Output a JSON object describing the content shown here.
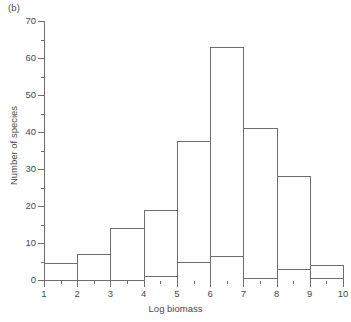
{
  "panel": {
    "label": "(b)"
  },
  "chart_data": {
    "type": "bar",
    "title": "",
    "xlabel": "Log biomass",
    "ylabel": "Number of species",
    "xlim": [
      1,
      10
    ],
    "ylim": [
      0,
      70
    ],
    "x_ticks": [
      1,
      2,
      3,
      4,
      5,
      6,
      7,
      8,
      9,
      10
    ],
    "x_tick_labels": [
      "1",
      "2",
      "3",
      "4",
      "5",
      "6",
      "7",
      "8",
      "9",
      "10"
    ],
    "y_ticks": [
      0,
      10,
      20,
      30,
      40,
      50,
      60,
      70
    ],
    "y_tick_labels": [
      "0",
      "10",
      "20",
      "30",
      "40",
      "50",
      "60",
      "70"
    ],
    "y_minor_ticks": [
      5,
      15,
      25,
      35,
      45,
      55,
      65
    ],
    "x_minor_ticks": [
      1.5,
      2.5,
      3.5,
      4.5,
      5.5,
      6.5,
      7.5,
      8.5,
      9.5
    ],
    "grid": false,
    "legend": null,
    "bin_edges": [
      1,
      2,
      3,
      4,
      5,
      6,
      7,
      8,
      9,
      10
    ],
    "bin_labels": [
      "1-2",
      "2-3",
      "3-4",
      "4-5",
      "5-6",
      "6-7",
      "7-8",
      "8-9",
      "9-10"
    ],
    "series": [
      {
        "name": "All species",
        "style": "open",
        "values": [
          4.5,
          7,
          14,
          19,
          37.5,
          63,
          41,
          28,
          4
        ]
      },
      {
        "name": "Stippled subset",
        "style": "stippled",
        "values": [
          0,
          0,
          0,
          1,
          5,
          6.5,
          0.5,
          3,
          0.5
        ]
      }
    ]
  },
  "colors": {
    "axis": "#6e6e6e",
    "text": "#4a4a4a",
    "bar_outline": "#6e6e6e",
    "stipple": "#5a5a5a",
    "background": "#ffffff"
  }
}
